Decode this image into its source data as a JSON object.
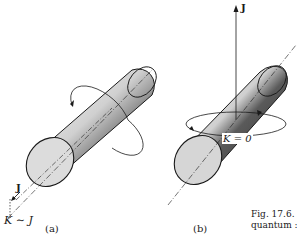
{
  "figure": {
    "panel_a": {
      "caption": "(a)",
      "vector_label": "J",
      "projection_label": "K ∼ J"
    },
    "panel_b": {
      "caption": "(b)",
      "vector_label": "J",
      "projection_label": "K = 0"
    },
    "caption_fragment": {
      "line1": "Fig. 17.6.",
      "line2": "quantum :"
    }
  },
  "colors": {
    "ink": "#1a1a1a",
    "face_light": "#d8d8d8",
    "shade_dark": "#3a3a3a"
  }
}
